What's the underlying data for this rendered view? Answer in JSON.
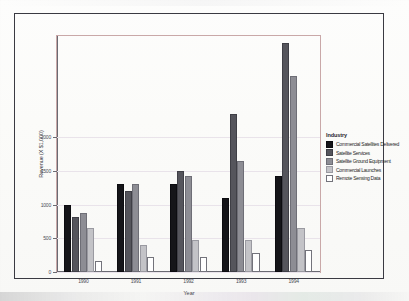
{
  "chart_data": {
    "type": "bar",
    "title": "",
    "xlabel": "Year",
    "ylabel": "Revenue (X $1,000)",
    "categories": [
      "1990",
      "1991",
      "1992",
      "1993",
      "1994"
    ],
    "legend_title": "Industry",
    "legend_position": "right",
    "grid": true,
    "ylim": [
      0,
      3500
    ],
    "yticks": [
      0,
      500,
      1000,
      1500,
      2000
    ],
    "ytick_labels": [
      "0",
      "500",
      "1000",
      "1500",
      "2000"
    ],
    "series": [
      {
        "name": "Commercial Satellites Delivered",
        "color": "#151519",
        "values": [
          1000,
          1310,
          1310,
          1100,
          1420
        ]
      },
      {
        "name": "Satellite Services",
        "color": "#55555c",
        "values": [
          820,
          1200,
          1500,
          2350,
          3400
        ]
      },
      {
        "name": "Satellite Ground Equipment",
        "color": "#8d8d94",
        "values": [
          870,
          1310,
          1420,
          1650,
          2900
        ]
      },
      {
        "name": "Commercial Launches",
        "color": "#c3c3c7",
        "values": [
          650,
          400,
          470,
          480,
          660
        ]
      },
      {
        "name": "Remote Sensing Data",
        "color": "#ffffff",
        "values": [
          160,
          220,
          230,
          280,
          330
        ]
      }
    ]
  },
  "legend": {
    "title": "Industry",
    "items": [
      {
        "label": "Commercial Satellites Delivered",
        "swatch": "s0"
      },
      {
        "label": "Satellite Services",
        "swatch": "s1"
      },
      {
        "label": "Satellite Ground Equipment",
        "swatch": "s2"
      },
      {
        "label": "Commercial Launches",
        "swatch": "s3"
      },
      {
        "label": "Remote Sensing Data",
        "swatch": "s4"
      }
    ]
  },
  "axes": {
    "x_title": "Year",
    "y_title": "Revenue (X $1,000)"
  }
}
